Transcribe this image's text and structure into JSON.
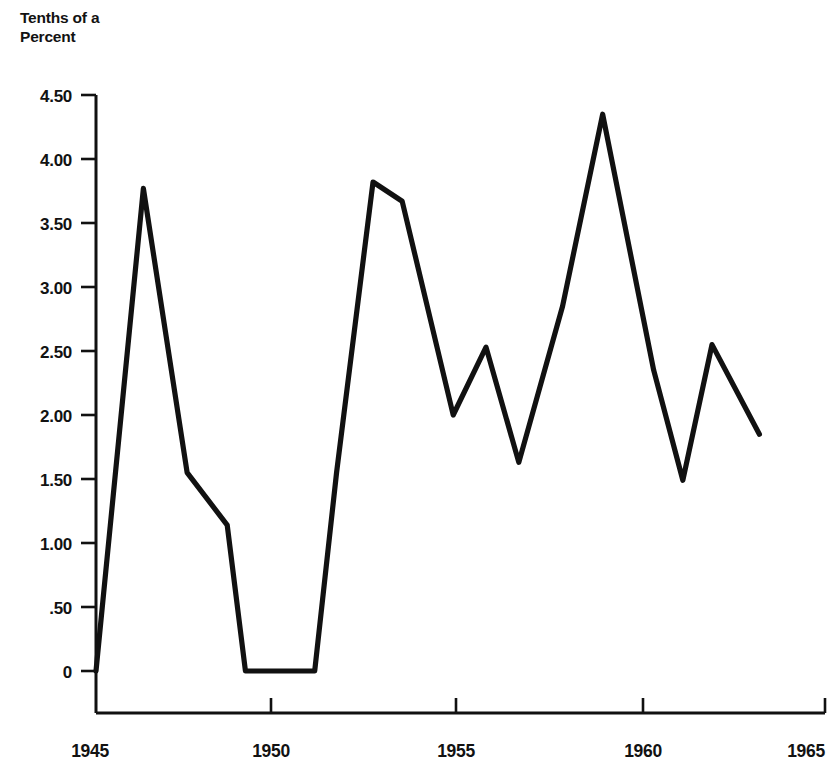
{
  "chart_data": {
    "type": "line",
    "title": "Tenths of a\nPercent",
    "title_line1": "Tenths of a",
    "title_line2": "Percent",
    "xlabel": "",
    "ylabel": "Tenths of a Percent",
    "grid": false,
    "legend": false,
    "xlim": [
      1945,
      1965
    ],
    "ylim": [
      0,
      4.5
    ],
    "x_tick_labels": [
      "1945",
      "1950",
      "1955",
      "1960",
      "1965"
    ],
    "x_ticks": [
      1945,
      1950,
      1955,
      1960,
      1965
    ],
    "y_tick_labels": [
      "4.50",
      "4.00",
      "3.50",
      "3.00",
      "2.50",
      "2.00",
      "1.50",
      "1.00",
      ".50",
      "0"
    ],
    "y_ticks": [
      4.5,
      4.0,
      3.5,
      3.0,
      2.5,
      2.0,
      1.5,
      1.0,
      0.5,
      0
    ],
    "line_color": "#111111",
    "series": [
      {
        "name": "rate",
        "x": [
          1945,
          1946.3,
          1947.5,
          1948.6,
          1949.1,
          1951.0,
          1951.6,
          1952.6,
          1953.4,
          1954.8,
          1955.7,
          1956.6,
          1957.8,
          1958.9,
          1960.3,
          1961.1,
          1961.9,
          1963.2
        ],
        "values": [
          0.0,
          3.77,
          1.55,
          1.14,
          0.0,
          0.0,
          1.55,
          3.82,
          3.67,
          2.0,
          2.53,
          1.63,
          2.85,
          4.35,
          2.35,
          1.49,
          2.55,
          1.85
        ]
      }
    ]
  }
}
